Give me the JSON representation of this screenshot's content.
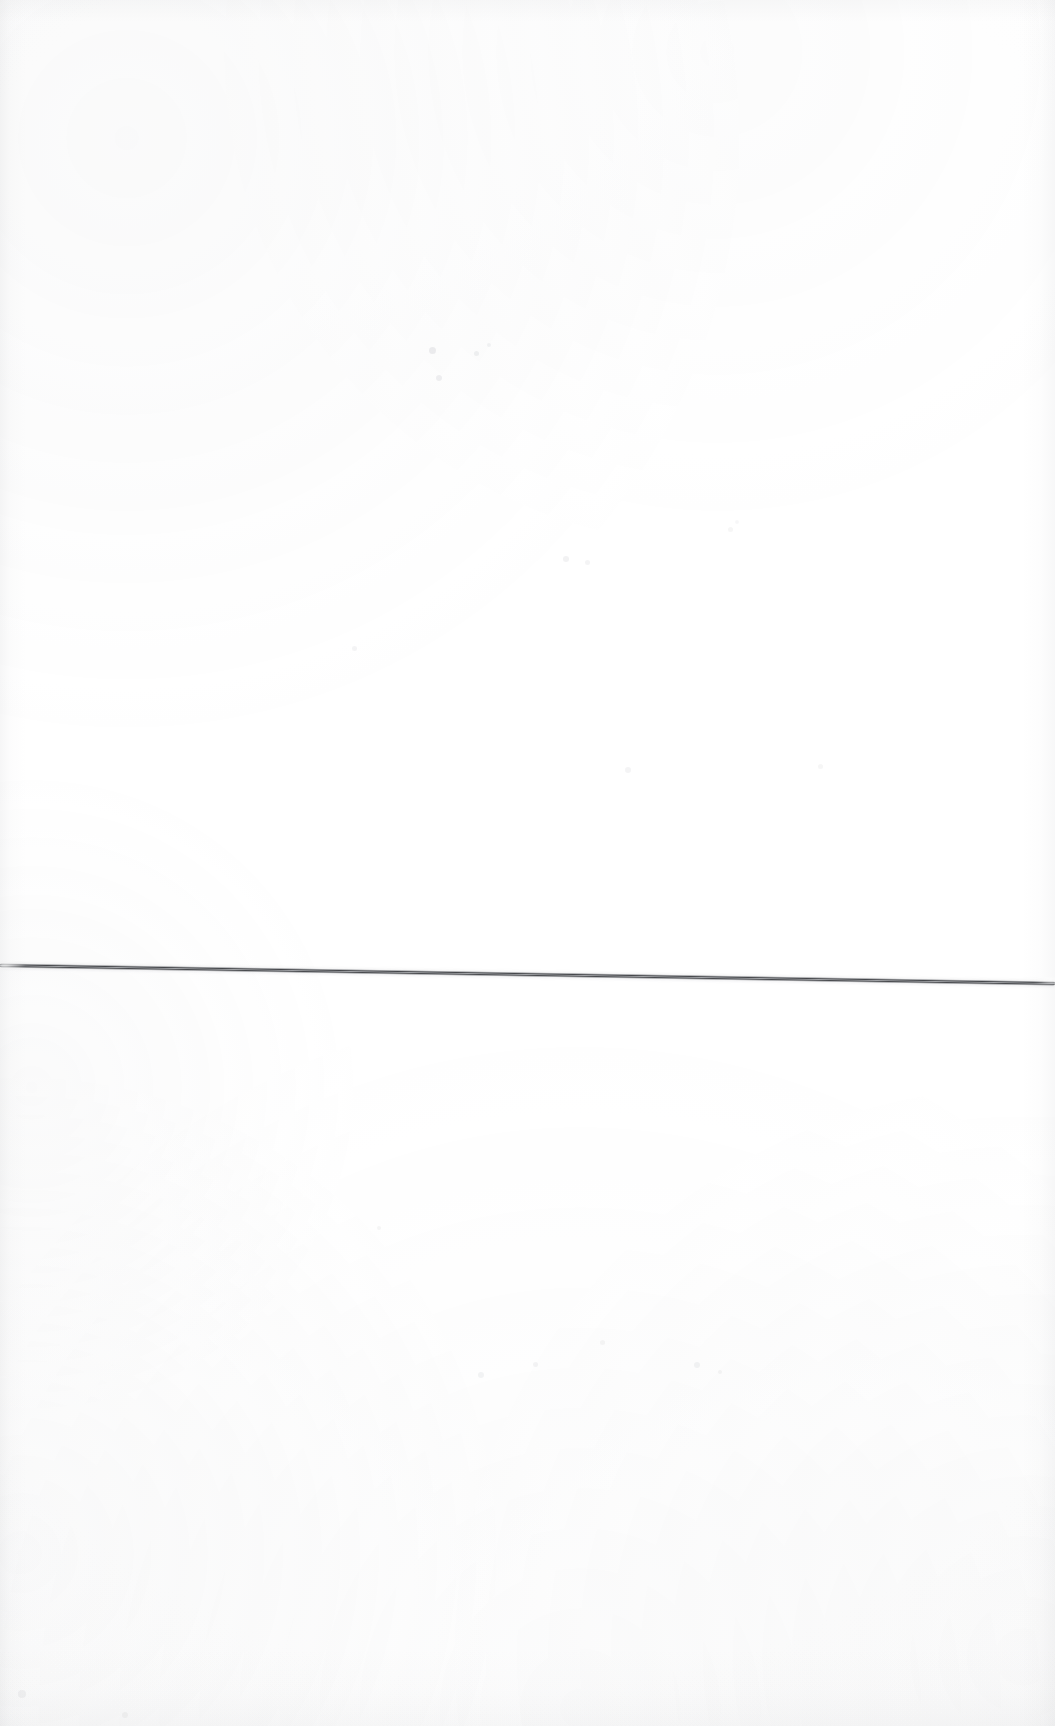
{
  "document": {
    "title": "Scanned blank page with single horizontal line",
    "page_label": "",
    "width_px": 1055,
    "height_px": 1726,
    "background_color": "#ffffff",
    "content_description": "Near-blank white scanned sheet; the only distinct mark is one thin dark horizontal line crossing the full width at a slight downward slope.",
    "visible_text": ""
  },
  "marks": {
    "primary_line": {
      "name": "horizontal-rule",
      "color": "#3a3c40",
      "highlight_color": "#969aa0",
      "thickness_px": 5,
      "start_x_px": 0,
      "start_y_px": 963,
      "end_x_px": 1055,
      "end_y_px": 981,
      "slope_degrees": 0.98,
      "spans_full_width": true
    },
    "specks": [
      {
        "name": "speck-upper-center-a",
        "x_px": 429,
        "y_px": 347,
        "size_px": 7,
        "opacity": 0.16
      },
      {
        "name": "speck-upper-center-b",
        "x_px": 436,
        "y_px": 375,
        "size_px": 6,
        "opacity": 0.14
      },
      {
        "name": "speck-upper-center-c",
        "x_px": 474,
        "y_px": 351,
        "size_px": 5,
        "opacity": 0.13
      },
      {
        "name": "speck-upper-center-d",
        "x_px": 487,
        "y_px": 343,
        "size_px": 4,
        "opacity": 0.11
      },
      {
        "name": "speck-mid-center-a",
        "x_px": 563,
        "y_px": 556,
        "size_px": 6,
        "opacity": 0.12
      },
      {
        "name": "speck-mid-center-b",
        "x_px": 585,
        "y_px": 560,
        "size_px": 5,
        "opacity": 0.1
      },
      {
        "name": "speck-mid-left",
        "x_px": 352,
        "y_px": 646,
        "size_px": 5,
        "opacity": 0.1
      },
      {
        "name": "speck-mid-right",
        "x_px": 728,
        "y_px": 527,
        "size_px": 5,
        "opacity": 0.09
      },
      {
        "name": "speck-right-upper",
        "x_px": 625,
        "y_px": 767,
        "size_px": 6,
        "opacity": 0.1
      },
      {
        "name": "speck-right-mid",
        "x_px": 818,
        "y_px": 764,
        "size_px": 5,
        "opacity": 0.09
      },
      {
        "name": "speck-lower-center-a",
        "x_px": 478,
        "y_px": 1372,
        "size_px": 6,
        "opacity": 0.11
      },
      {
        "name": "speck-lower-center-b",
        "x_px": 533,
        "y_px": 1362,
        "size_px": 5,
        "opacity": 0.1
      },
      {
        "name": "speck-lower-right-a",
        "x_px": 694,
        "y_px": 1362,
        "size_px": 6,
        "opacity": 0.11
      },
      {
        "name": "speck-lower-right-b",
        "x_px": 718,
        "y_px": 1370,
        "size_px": 4,
        "opacity": 0.09
      },
      {
        "name": "speck-lower-far-left",
        "x_px": 377,
        "y_px": 1226,
        "size_px": 4,
        "opacity": 0.09
      },
      {
        "name": "speck-lower-mid",
        "x_px": 600,
        "y_px": 1340,
        "size_px": 5,
        "opacity": 0.09
      },
      {
        "name": "speck-bottom-left",
        "x_px": 18,
        "y_px": 1690,
        "size_px": 8,
        "opacity": 0.1
      },
      {
        "name": "speck-bottom-center",
        "x_px": 122,
        "y_px": 1712,
        "size_px": 6,
        "opacity": 0.09
      },
      {
        "name": "speck-top-right",
        "x_px": 735,
        "y_px": 520,
        "size_px": 4,
        "opacity": 0.08
      }
    ]
  },
  "edges": {
    "left_shade_color": "#96989e",
    "right_shade_color": "#96989e",
    "top_shade_color": "#96989e",
    "bottom_shade_color": "#96989e"
  }
}
